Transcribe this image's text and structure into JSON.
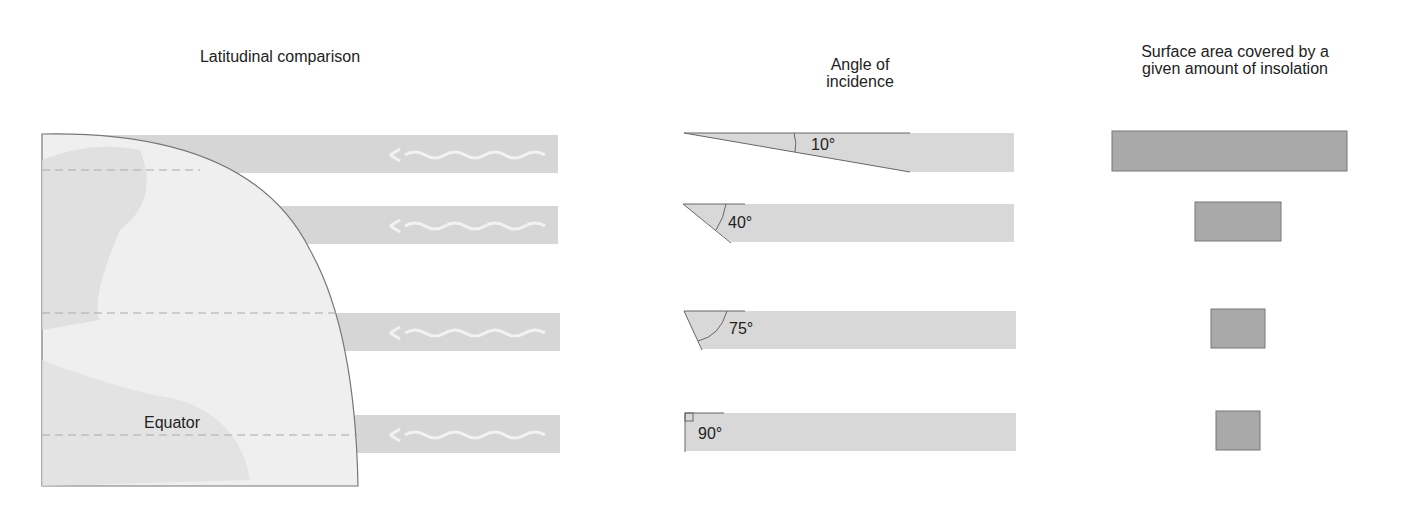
{
  "titles": {
    "left": "Latitudinal comparison",
    "middle_line1": "Angle of",
    "middle_line2": "incidence",
    "right_line1": "Surface area covered by a",
    "right_line2": "given amount of insolation"
  },
  "globe": {
    "equator_label": "Equator"
  },
  "angles": [
    {
      "label": "10°",
      "degrees": 10,
      "area_width": 235
    },
    {
      "label": "40°",
      "degrees": 40,
      "area_width": 86
    },
    {
      "label": "75°",
      "degrees": 75,
      "area_width": 54
    },
    {
      "label": "90°",
      "degrees": 90,
      "area_width": 44
    }
  ],
  "colors": {
    "beam": "#d8d8d8",
    "area": "#a9a9a9",
    "globe": "#efefef",
    "land": "#dcdcdc"
  }
}
